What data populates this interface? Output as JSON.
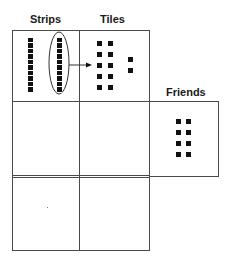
{
  "labels": {
    "strips": "Strips",
    "tiles": "Tiles",
    "friends": "Friends"
  },
  "diagram": {
    "strips": {
      "count": 2,
      "squares_per_strip": 10,
      "circled_strip": 2
    },
    "tiles": {
      "grouped": 10,
      "extra": 2
    },
    "friends": {
      "tiles": 8
    },
    "colors": {
      "line": "#4a4a4a",
      "fill": "#111111",
      "background": "#ffffff"
    }
  }
}
